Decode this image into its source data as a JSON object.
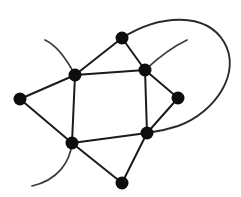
{
  "figure": {
    "background_color": "#ffffff",
    "width": 241,
    "height": 197
  },
  "style": {
    "edge_color": "#1b1b1b",
    "curve_color": "#2a2a2a",
    "pendant_color": "#3a3a3a",
    "vertex_color": "#0d0d0d",
    "vertex_radius": 6.5,
    "edge_width": 2
  },
  "graph": {
    "vertex_count": 8,
    "edge_count": 12,
    "vertices": [
      {
        "id": "v-top",
        "label": "top vertex",
        "x": 122,
        "y": 38
      },
      {
        "id": "v-upper-left",
        "label": "upper left vertex",
        "x": 75,
        "y": 75
      },
      {
        "id": "v-upper-right",
        "label": "upper right vertex",
        "x": 145,
        "y": 70
      },
      {
        "id": "v-left",
        "label": "far left vertex",
        "x": 20,
        "y": 99
      },
      {
        "id": "v-right",
        "label": "far right vertex",
        "x": 178,
        "y": 98
      },
      {
        "id": "v-lower-left",
        "label": "lower left vertex",
        "x": 72,
        "y": 143
      },
      {
        "id": "v-lower-right",
        "label": "lower right vertex",
        "x": 147,
        "y": 133
      },
      {
        "id": "v-bottom",
        "label": "bottom vertex",
        "x": 122,
        "y": 183
      }
    ],
    "edges": [
      {
        "id": "e-top-ul",
        "from": "v-top",
        "to": "v-upper-left",
        "kind": "straight",
        "path": "M 122 38 L 75 75"
      },
      {
        "id": "e-top-ur",
        "from": "v-top",
        "to": "v-upper-right",
        "kind": "straight",
        "path": "M 122 38 L 145 70"
      },
      {
        "id": "e-ul-ur",
        "from": "v-upper-left",
        "to": "v-upper-right",
        "kind": "straight",
        "path": "M 75 75 L 145 70"
      },
      {
        "id": "e-ul-ll",
        "from": "v-upper-left",
        "to": "v-lower-left",
        "kind": "straight",
        "path": "M 75 75 L 72 143"
      },
      {
        "id": "e-ur-lr",
        "from": "v-upper-right",
        "to": "v-lower-right",
        "kind": "straight",
        "path": "M 145 70 L 147 133"
      },
      {
        "id": "e-ll-lr",
        "from": "v-lower-left",
        "to": "v-lower-right",
        "kind": "straight",
        "path": "M 72 143 L 147 133"
      },
      {
        "id": "e-left-ul",
        "from": "v-left",
        "to": "v-upper-left",
        "kind": "straight",
        "path": "M 20 99 L 75 75"
      },
      {
        "id": "e-left-ll",
        "from": "v-left",
        "to": "v-lower-left",
        "kind": "straight",
        "path": "M 20 99 L 72 143"
      },
      {
        "id": "e-ur-right",
        "from": "v-upper-right",
        "to": "v-right",
        "kind": "straight",
        "path": "M 145 70 L 178 98"
      },
      {
        "id": "e-right-lr",
        "from": "v-right",
        "to": "v-lower-right",
        "kind": "straight",
        "path": "M 178 98 L 147 133"
      },
      {
        "id": "e-ll-bot",
        "from": "v-lower-left",
        "to": "v-bottom",
        "kind": "straight",
        "path": "M 72 143 L 122 183"
      },
      {
        "id": "e-bot-lr",
        "from": "v-bottom",
        "to": "v-lower-right",
        "kind": "straight",
        "path": "M 122 183 L 147 133"
      },
      {
        "id": "e-loop-top-lr",
        "from": "v-top",
        "to": "v-lower-right",
        "kind": "curved",
        "path": "M 122 38 C 160 14 206 12 224 42 C 242 72 216 112 178 126 C 166 130 155 132 147 133"
      }
    ],
    "pendant_arcs": [
      {
        "id": "arc-upper-left",
        "from": "v-upper-left",
        "label": "pendant arc upper left",
        "path": "M 75 75 C 66 58 56 45 45 40"
      },
      {
        "id": "arc-upper-right",
        "from": "v-upper-right",
        "label": "pendant arc upper right",
        "path": "M 145 70 C 158 58 172 47 187 40"
      },
      {
        "id": "arc-lower-left",
        "from": "v-lower-left",
        "label": "pendant arc lower left",
        "path": "M 72 143 C 70 162 58 180 32 186"
      }
    ]
  }
}
